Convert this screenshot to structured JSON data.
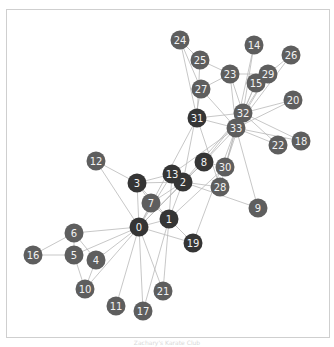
{
  "graph": {
    "colors": {
      "dark": "#353535",
      "light": "#5e5e5e",
      "edge": "#b9b9b9",
      "label": "#f2f2f2",
      "frame": "#cfcfcf"
    },
    "node_radius": 9.5,
    "nodes": [
      {
        "id": "0",
        "x": 139,
        "y": 227,
        "group": "dark"
      },
      {
        "id": "1",
        "x": 169,
        "y": 219,
        "group": "dark"
      },
      {
        "id": "2",
        "x": 183,
        "y": 182,
        "group": "dark"
      },
      {
        "id": "3",
        "x": 137,
        "y": 183,
        "group": "dark"
      },
      {
        "id": "4",
        "x": 96,
        "y": 260,
        "group": "light"
      },
      {
        "id": "5",
        "x": 74,
        "y": 255,
        "group": "light"
      },
      {
        "id": "6",
        "x": 74,
        "y": 233,
        "group": "light"
      },
      {
        "id": "7",
        "x": 151,
        "y": 203,
        "group": "light"
      },
      {
        "id": "8",
        "x": 204,
        "y": 162,
        "group": "dark"
      },
      {
        "id": "9",
        "x": 258,
        "y": 208,
        "group": "light"
      },
      {
        "id": "10",
        "x": 85,
        "y": 289,
        "group": "light"
      },
      {
        "id": "11",
        "x": 116,
        "y": 306,
        "group": "light"
      },
      {
        "id": "12",
        "x": 96,
        "y": 161,
        "group": "light"
      },
      {
        "id": "13",
        "x": 172,
        "y": 174,
        "group": "dark"
      },
      {
        "id": "14",
        "x": 254,
        "y": 45,
        "group": "light"
      },
      {
        "id": "15",
        "x": 256,
        "y": 83,
        "group": "light"
      },
      {
        "id": "16",
        "x": 33,
        "y": 255,
        "group": "light"
      },
      {
        "id": "17",
        "x": 143,
        "y": 311,
        "group": "light"
      },
      {
        "id": "18",
        "x": 301,
        "y": 141,
        "group": "light"
      },
      {
        "id": "19",
        "x": 193,
        "y": 243,
        "group": "dark"
      },
      {
        "id": "20",
        "x": 293,
        "y": 100,
        "group": "light"
      },
      {
        "id": "21",
        "x": 163,
        "y": 291,
        "group": "light"
      },
      {
        "id": "22",
        "x": 278,
        "y": 145,
        "group": "light"
      },
      {
        "id": "23",
        "x": 230,
        "y": 74,
        "group": "light"
      },
      {
        "id": "24",
        "x": 180,
        "y": 40,
        "group": "light"
      },
      {
        "id": "25",
        "x": 200,
        "y": 60,
        "group": "light"
      },
      {
        "id": "26",
        "x": 291,
        "y": 55,
        "group": "light"
      },
      {
        "id": "27",
        "x": 201,
        "y": 89,
        "group": "light"
      },
      {
        "id": "28",
        "x": 220,
        "y": 187,
        "group": "light"
      },
      {
        "id": "29",
        "x": 268,
        "y": 74,
        "group": "light"
      },
      {
        "id": "30",
        "x": 225,
        "y": 167,
        "group": "light"
      },
      {
        "id": "31",
        "x": 197,
        "y": 118,
        "group": "dark"
      },
      {
        "id": "32",
        "x": 243,
        "y": 113,
        "group": "light"
      },
      {
        "id": "33",
        "x": 236,
        "y": 128,
        "group": "light"
      }
    ],
    "edges": [
      [
        0,
        1
      ],
      [
        0,
        2
      ],
      [
        0,
        3
      ],
      [
        0,
        4
      ],
      [
        0,
        5
      ],
      [
        0,
        6
      ],
      [
        0,
        7
      ],
      [
        0,
        8
      ],
      [
        0,
        10
      ],
      [
        0,
        11
      ],
      [
        0,
        12
      ],
      [
        0,
        13
      ],
      [
        0,
        17
      ],
      [
        0,
        19
      ],
      [
        0,
        21
      ],
      [
        0,
        31
      ],
      [
        1,
        2
      ],
      [
        1,
        3
      ],
      [
        1,
        7
      ],
      [
        1,
        13
      ],
      [
        1,
        17
      ],
      [
        1,
        19
      ],
      [
        1,
        21
      ],
      [
        1,
        30
      ],
      [
        2,
        3
      ],
      [
        2,
        7
      ],
      [
        2,
        8
      ],
      [
        2,
        9
      ],
      [
        2,
        13
      ],
      [
        2,
        27
      ],
      [
        2,
        28
      ],
      [
        2,
        32
      ],
      [
        3,
        7
      ],
      [
        3,
        12
      ],
      [
        3,
        13
      ],
      [
        4,
        6
      ],
      [
        4,
        10
      ],
      [
        5,
        6
      ],
      [
        5,
        10
      ],
      [
        5,
        16
      ],
      [
        6,
        16
      ],
      [
        8,
        30
      ],
      [
        8,
        32
      ],
      [
        8,
        33
      ],
      [
        9,
        33
      ],
      [
        13,
        33
      ],
      [
        14,
        32
      ],
      [
        14,
        33
      ],
      [
        15,
        32
      ],
      [
        15,
        33
      ],
      [
        18,
        32
      ],
      [
        18,
        33
      ],
      [
        19,
        33
      ],
      [
        20,
        32
      ],
      [
        20,
        33
      ],
      [
        22,
        32
      ],
      [
        22,
        33
      ],
      [
        23,
        25
      ],
      [
        23,
        27
      ],
      [
        23,
        29
      ],
      [
        23,
        32
      ],
      [
        23,
        33
      ],
      [
        24,
        25
      ],
      [
        24,
        27
      ],
      [
        24,
        31
      ],
      [
        25,
        31
      ],
      [
        26,
        29
      ],
      [
        26,
        33
      ],
      [
        27,
        33
      ],
      [
        28,
        31
      ],
      [
        28,
        33
      ],
      [
        29,
        32
      ],
      [
        29,
        33
      ],
      [
        30,
        32
      ],
      [
        30,
        33
      ],
      [
        31,
        32
      ],
      [
        31,
        33
      ],
      [
        32,
        33
      ]
    ]
  },
  "caption": "Zachary's Karate Club"
}
